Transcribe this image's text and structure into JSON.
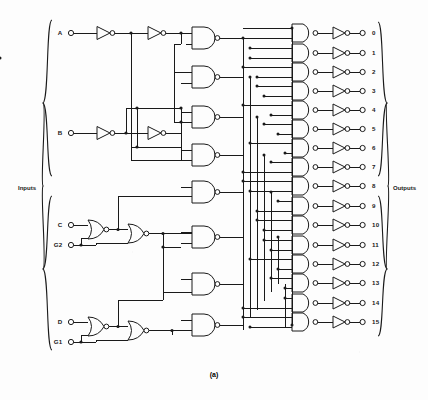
{
  "figure": {
    "caption": "(a)",
    "line_color": "#1a1a1a",
    "background": "#fdfdfd"
  },
  "sections": {
    "inputs_label": "Inputs",
    "outputs_label": "Outputs"
  },
  "inputs": [
    {
      "name": "A",
      "label": "A",
      "y": 33,
      "type": "data"
    },
    {
      "name": "B",
      "label": "B",
      "y": 133,
      "type": "data"
    },
    {
      "name": "C",
      "label": "C",
      "y": 225,
      "type": "data"
    },
    {
      "name": "G2",
      "label": "G2",
      "y": 245,
      "type": "enable"
    },
    {
      "name": "D",
      "label": "D",
      "y": 322,
      "type": "data"
    },
    {
      "name": "G1",
      "label": "G1",
      "y": 342,
      "type": "enable"
    }
  ],
  "outputs": [
    {
      "label": "0",
      "y": 33
    },
    {
      "label": "1",
      "y": 53
    },
    {
      "label": "2",
      "y": 72
    },
    {
      "label": "3",
      "y": 91
    },
    {
      "label": "4",
      "y": 110
    },
    {
      "label": "5",
      "y": 129
    },
    {
      "label": "6",
      "y": 148
    },
    {
      "label": "7",
      "y": 167
    },
    {
      "label": "8",
      "y": 186
    },
    {
      "label": "9",
      "y": 206
    },
    {
      "label": "10",
      "y": 225
    },
    {
      "label": "11",
      "y": 245
    },
    {
      "label": "12",
      "y": 264
    },
    {
      "label": "13",
      "y": 283
    },
    {
      "label": "14",
      "y": 303
    },
    {
      "label": "15",
      "y": 322
    }
  ],
  "gates": {
    "input_inverters": [
      {
        "name": "inv-A1",
        "x": 97,
        "y": 33
      },
      {
        "name": "inv-A2",
        "x": 148,
        "y": 33
      },
      {
        "name": "inv-B1",
        "x": 97,
        "y": 133
      },
      {
        "name": "inv-B2",
        "x": 148,
        "y": 133
      }
    ],
    "enable_nor_gates": [
      {
        "name": "nor-C-G2",
        "x": 88,
        "y": 229
      },
      {
        "name": "nor-stage2-C",
        "x": 128,
        "y": 233
      },
      {
        "name": "nor-D-G1",
        "x": 88,
        "y": 326
      },
      {
        "name": "nor-stage2-D",
        "x": 128,
        "y": 330
      }
    ],
    "driver_nand_gates": [
      {
        "name": "nand-drv-1",
        "x": 192,
        "y": 38
      },
      {
        "name": "nand-drv-2",
        "x": 192,
        "y": 77
      },
      {
        "name": "nand-drv-3",
        "x": 192,
        "y": 117
      },
      {
        "name": "nand-drv-4",
        "x": 192,
        "y": 155
      },
      {
        "name": "nand-drv-5",
        "x": 192,
        "y": 192
      },
      {
        "name": "nand-drv-6",
        "x": 192,
        "y": 237
      },
      {
        "name": "nand-drv-7",
        "x": 192,
        "y": 284
      },
      {
        "name": "nand-drv-8",
        "x": 192,
        "y": 325
      }
    ],
    "output_nand_count": 16,
    "output_inverter_count": 16
  },
  "counts": {
    "inputs": 6,
    "outputs": 16
  }
}
